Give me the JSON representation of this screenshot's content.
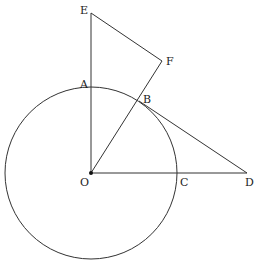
{
  "diagram": {
    "type": "geometry",
    "circle": {
      "center": "O",
      "cx": 91,
      "cy": 173,
      "r": 86
    },
    "points": {
      "E": {
        "label": "E",
        "x": 91,
        "y": 13,
        "lx": 80,
        "ly": 14
      },
      "F": {
        "label": "F",
        "x": 162,
        "y": 61,
        "lx": 166,
        "ly": 65
      },
      "A": {
        "label": "A",
        "x": 91,
        "y": 87,
        "lx": 80,
        "ly": 83
      },
      "B": {
        "label": "B",
        "x": 139,
        "y": 101,
        "lx": 143,
        "ly": 102
      },
      "O": {
        "label": "O",
        "x": 91,
        "y": 173,
        "lx": 80,
        "ly": 186
      },
      "C": {
        "label": "C",
        "x": 177,
        "y": 173,
        "lx": 180,
        "ly": 186
      },
      "D": {
        "label": "D",
        "x": 247,
        "y": 173,
        "lx": 245,
        "ly": 186
      }
    },
    "segments": [
      [
        "E",
        "O"
      ],
      [
        "E",
        "F"
      ],
      [
        "F",
        "O"
      ],
      [
        "B",
        "D"
      ],
      [
        "O",
        "D"
      ]
    ]
  }
}
